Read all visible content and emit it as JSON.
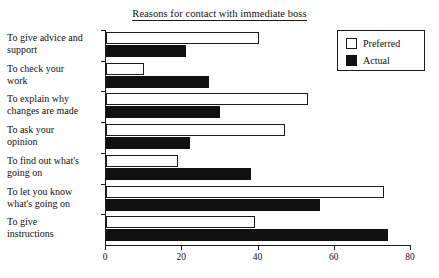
{
  "chart_data": {
    "type": "bar",
    "orientation": "horizontal",
    "title": "Reasons for contact with immediate boss",
    "xlabel": "",
    "ylabel": "",
    "xlim": [
      0,
      80
    ],
    "xticks": [
      0,
      20,
      40,
      60,
      80
    ],
    "grid": false,
    "legend_position": "top-right",
    "categories": [
      "To give advice and support",
      "To check your work",
      "To explain why changes are made",
      "To ask your opinion",
      "To find out what's going on",
      "To let you know what's going on",
      "To give instructions"
    ],
    "category_lines": [
      [
        "To give advice and",
        "support"
      ],
      [
        "To check your",
        "work"
      ],
      [
        "To explain why",
        "changes are made"
      ],
      [
        "To ask your",
        "opinion"
      ],
      [
        "To find out what's",
        "going on"
      ],
      [
        "To let you know",
        "what's going on"
      ],
      [
        "To give",
        "instructions"
      ]
    ],
    "series": [
      {
        "name": "Preferred",
        "color": "#ffffff",
        "edge_color": "#1a1a1a",
        "values": [
          40,
          10,
          53,
          47,
          19,
          73,
          39
        ]
      },
      {
        "name": "Actual",
        "color": "#111111",
        "edge_color": "#111111",
        "values": [
          21,
          27,
          30,
          22,
          38,
          56,
          74
        ]
      }
    ]
  },
  "legend": {
    "items": [
      {
        "label": "Preferred",
        "swatch": "preferred-swatch"
      },
      {
        "label": "Actual",
        "swatch": "actual-swatch"
      }
    ]
  }
}
